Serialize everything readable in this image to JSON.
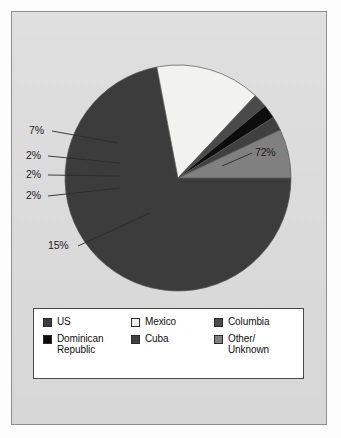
{
  "figure": {
    "background_color": "#dddddd",
    "frame_color": "#8e8e8e",
    "page_color": "#fdfdfd"
  },
  "chart_data": {
    "type": "pie",
    "title": "",
    "subtitle": "",
    "xlabel": "",
    "ylabel": "",
    "grid": false,
    "legend_position": "bottom",
    "units": "percent",
    "categories": [
      "US",
      "Mexico",
      "Columbia",
      "Dominican Republic",
      "Cuba",
      "Other/Unknown"
    ],
    "values": [
      72,
      15,
      2,
      2,
      2,
      7
    ],
    "labels": [
      "72%",
      "15%",
      "2%",
      "2%",
      "2%",
      "7%"
    ],
    "colors": [
      "#3c3c3c",
      "#f2f2f0",
      "#4a4a4a",
      "#0d0d0d",
      "#404040",
      "#808080"
    ],
    "slices": [
      {
        "name": "US",
        "value": 72,
        "label": "72%",
        "color": "#3c3c3c",
        "start_angle": 0,
        "end_angle": 259.2
      },
      {
        "name": "Mexico",
        "value": 15,
        "label": "15%",
        "color": "#f2f2f0",
        "start_angle": 259.2,
        "end_angle": 313.2
      },
      {
        "name": "Columbia",
        "value": 2,
        "label": "2%",
        "color": "#4a4a4a",
        "start_angle": 313.2,
        "end_angle": 320.4
      },
      {
        "name": "Dominican Republic",
        "value": 2,
        "label": "2%",
        "color": "#0d0d0d",
        "start_angle": 320.4,
        "end_angle": 327.6
      },
      {
        "name": "Cuba",
        "value": 2,
        "label": "2%",
        "color": "#404040",
        "start_angle": 327.6,
        "end_angle": 334.8
      },
      {
        "name": "Other/Unknown",
        "value": 7,
        "label": "7%",
        "color": "#808080",
        "start_angle": 334.8,
        "end_angle": 360
      }
    ]
  },
  "callouts": [
    {
      "id": "callout-72",
      "text": "72%"
    },
    {
      "id": "callout-15",
      "text": "15%"
    },
    {
      "id": "callout-7",
      "text": "7%"
    },
    {
      "id": "callout-2-columbia",
      "text": "2%"
    },
    {
      "id": "callout-2-dominican",
      "text": "2%"
    },
    {
      "id": "callout-2-cuba",
      "text": "2%"
    }
  ],
  "legend": {
    "items": [
      {
        "label": "US",
        "color": "#3c3c3c"
      },
      {
        "label": "Mexico",
        "color": "#f2f2f0"
      },
      {
        "label": "Columbia",
        "color": "#4a4a4a"
      },
      {
        "label": "Dominican Republic",
        "color": "#0d0d0d"
      },
      {
        "label": "Cuba",
        "color": "#404040"
      },
      {
        "label": "Other/ Unknown",
        "color": "#808080"
      }
    ]
  }
}
